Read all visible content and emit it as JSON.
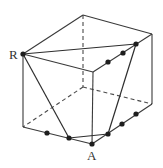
{
  "figure": {
    "width": 163,
    "height": 168,
    "colors": {
      "line": "#3a3a3a",
      "point": "#1e1e1e",
      "label": "#333333",
      "background": "#ffffff"
    }
  },
  "labels": {
    "R": "R",
    "A": "A"
  },
  "vertices": {
    "top_back": [
      83,
      15
    ],
    "top_right": [
      152,
      34
    ],
    "R": [
      23,
      54
    ],
    "top_front": [
      93,
      72
    ],
    "bottom_left": [
      23,
      127
    ],
    "A": [
      92,
      144
    ],
    "bottom_right": [
      152,
      104
    ],
    "bottom_back_hidden": [
      83,
      87
    ]
  },
  "marked_points": {
    "top_right_edge": [
      [
        136,
        44
      ],
      [
        123,
        53
      ],
      [
        108,
        62
      ]
    ],
    "bottom_left_edge": [
      [
        47,
        133
      ],
      [
        69,
        138
      ]
    ],
    "bottom_right_edge": [
      [
        108,
        134
      ],
      [
        122,
        124
      ],
      [
        136,
        114
      ]
    ]
  }
}
